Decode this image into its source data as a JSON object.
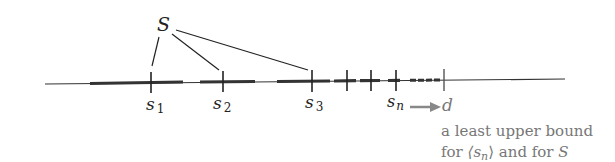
{
  "set_label": "S",
  "points": [
    {
      "name": "s",
      "sub": "1"
    },
    {
      "name": "s",
      "sub": "2"
    },
    {
      "name": "s",
      "sub": "3"
    },
    {
      "name": "s",
      "sub": "n"
    }
  ],
  "limit_label": "d",
  "caption": {
    "line1": "a least upper bound",
    "line2_pre": "for ",
    "line2_seq": "⟨s",
    "line2_sub": "n",
    "line2_close": "⟩",
    "line2_mid": " and for ",
    "line2_set": "S"
  },
  "colors": {
    "ink": "#222222",
    "caption": "#777777",
    "arrow": "#888888"
  }
}
